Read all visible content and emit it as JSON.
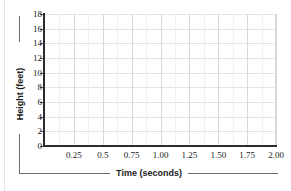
{
  "chart_data": {
    "type": "line",
    "title": "",
    "subtitle": "",
    "xlabel": "Time (seconds)",
    "ylabel": "Height (feet)",
    "xlim": [
      0,
      2.0
    ],
    "ylim": [
      0,
      18
    ],
    "grid": true,
    "legend": null,
    "series": [],
    "x": [],
    "values": [],
    "annotations": [],
    "note": "Empty plotting grid; no data plotted",
    "x_ticks": [
      {
        "value": 0.25,
        "label": "0.25"
      },
      {
        "value": 0.5,
        "label": "0.5"
      },
      {
        "value": 0.75,
        "label": "0.75"
      },
      {
        "value": 1.0,
        "label": "1.00"
      },
      {
        "value": 1.25,
        "label": "1.25"
      },
      {
        "value": 1.5,
        "label": "1.50"
      },
      {
        "value": 1.75,
        "label": "1.75"
      },
      {
        "value": 2.0,
        "label": "2.00"
      }
    ],
    "y_ticks": [
      {
        "value": 0,
        "label": "0"
      },
      {
        "value": 2,
        "label": "2"
      },
      {
        "value": 4,
        "label": "4"
      },
      {
        "value": 6,
        "label": "6"
      },
      {
        "value": 8,
        "label": "8"
      },
      {
        "value": 10,
        "label": "10"
      },
      {
        "value": 12,
        "label": "12"
      },
      {
        "value": 14,
        "label": "14"
      },
      {
        "value": 16,
        "label": "16"
      },
      {
        "value": 18,
        "label": "18"
      }
    ],
    "colors": {
      "background": "#ffffff",
      "axis": "#2b2b2b",
      "gridline_major": "#d8d8d8",
      "gridline_minor": "#f0f0f0",
      "gridline_horizontal": "#e3e3e3",
      "text": "#1b1b1b",
      "rule": "#6e6e6e"
    }
  }
}
